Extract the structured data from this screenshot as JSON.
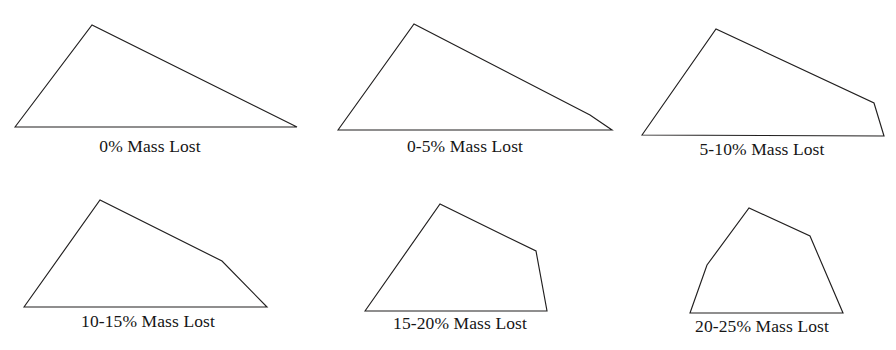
{
  "figure": {
    "background_color": "#ffffff",
    "stroke_color": "#211f1f",
    "text_color": "#161616",
    "width": 896,
    "height": 350
  },
  "chart_data": {
    "type": "diagram",
    "rows": 2,
    "columns": 3,
    "grid": true,
    "legend": "none",
    "categories": [
      "0% Mass Lost",
      "0-5% Mass Lost",
      "5-10% Mass Lost",
      "10-15% Mass Lost",
      "15-20% Mass Lost",
      "20-25% Mass Lost"
    ],
    "panels": [
      {
        "index": 1,
        "label": "0% Mass Lost",
        "row": 1,
        "column": 1,
        "vertex_count": 3,
        "polygon": [
          [
            15,
            127
          ],
          [
            92,
            25
          ],
          [
            297,
            127
          ]
        ],
        "caption_x": 150,
        "caption_y": 152
      },
      {
        "index": 2,
        "label": "0-5% Mass Lost",
        "row": 1,
        "column": 2,
        "vertex_count": 4,
        "polygon": [
          [
            338,
            130
          ],
          [
            414,
            24
          ],
          [
            590,
            115
          ],
          [
            612,
            130
          ]
        ],
        "caption_x": 465,
        "caption_y": 152
      },
      {
        "index": 3,
        "label": "5-10% Mass Lost",
        "row": 1,
        "column": 3,
        "vertex_count": 4,
        "polygon": [
          [
            642,
            135
          ],
          [
            716,
            29
          ],
          [
            874,
            103
          ],
          [
            884,
            136
          ]
        ],
        "caption_x": 762,
        "caption_y": 155
      },
      {
        "index": 4,
        "label": "10-15% Mass Lost",
        "row": 2,
        "column": 1,
        "vertex_count": 4,
        "polygon": [
          [
            24,
            307
          ],
          [
            100,
            200
          ],
          [
            222,
            261
          ],
          [
            267,
            307
          ]
        ],
        "caption_x": 148,
        "caption_y": 327
      },
      {
        "index": 5,
        "label": "15-20% Mass Lost",
        "row": 2,
        "column": 2,
        "vertex_count": 4,
        "polygon": [
          [
            365,
            311
          ],
          [
            440,
            204
          ],
          [
            536,
            251
          ],
          [
            547,
            311
          ]
        ],
        "caption_x": 460,
        "caption_y": 329
      },
      {
        "index": 6,
        "label": "20-25% Mass Lost",
        "row": 2,
        "column": 3,
        "vertex_count": 5,
        "polygon": [
          [
            690,
            313
          ],
          [
            707,
            265
          ],
          [
            749,
            208
          ],
          [
            810,
            236
          ],
          [
            843,
            313
          ]
        ],
        "caption_x": 762,
        "caption_y": 332
      }
    ]
  }
}
